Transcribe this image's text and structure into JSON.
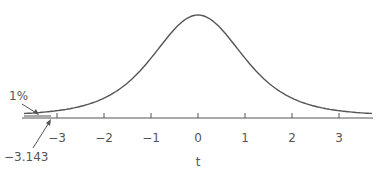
{
  "chart_data": {
    "type": "line",
    "title": "",
    "xlabel": "t",
    "ylabel": "",
    "xlim": [
      -3.6,
      3.6
    ],
    "x_ticks": [
      -3,
      -2,
      -1,
      0,
      1,
      2,
      3
    ],
    "x_tick_labels": [
      "−3",
      "−2",
      "−1",
      "0",
      "1",
      "2",
      "3"
    ],
    "series": [
      {
        "name": "t-distribution density",
        "distribution": "Student t",
        "center": 0
      }
    ],
    "shaded_tail": {
      "from": -3.6,
      "to": -3.143,
      "area": "1%"
    },
    "annotations": [
      {
        "text": "1%",
        "points_to": "left tail area"
      },
      {
        "text": "−3.143",
        "points_to": "critical value on x-axis"
      }
    ],
    "grid": false,
    "legend": null
  },
  "labels": {
    "xlabel": "t",
    "tail_percent": "1%",
    "critical_value": "−3.143",
    "ticks": [
      "−3",
      "−2",
      "−1",
      "0",
      "1",
      "2",
      "3"
    ]
  },
  "colors": {
    "curve": "#555555",
    "axis": "#555555",
    "text": "#555555"
  }
}
